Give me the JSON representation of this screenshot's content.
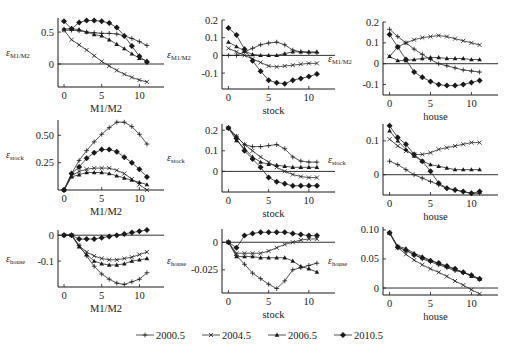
{
  "chart_data": {
    "type": "line",
    "layout": "3x3 grid of small-multiple line charts",
    "legend": {
      "placement": "bottom-center",
      "entries": [
        {
          "name": "2000.5",
          "marker": "plus"
        },
        {
          "name": "2004.5",
          "marker": "cross"
        },
        {
          "name": "2006.5",
          "marker": "triangle"
        },
        {
          "name": "2010.5",
          "marker": "diamond"
        }
      ]
    },
    "x": [
      0,
      1,
      2,
      3,
      4,
      5,
      6,
      7,
      8,
      9,
      10,
      11
    ],
    "panels": [
      {
        "id": "m1m2-response-to-m1m2",
        "ylabel_main": "ε",
        "ylabel_sub": "M1/M2",
        "xlabel": "M1/M2",
        "xticks": [
          0,
          5,
          10
        ],
        "xlim": [
          -0.8,
          13
        ],
        "yticks": [
          0,
          0.5
        ],
        "ytick_labels": [
          "0",
          "0.5"
        ],
        "ylim": [
          -0.36,
          0.72
        ],
        "series": [
          {
            "name": "2000.5",
            "values": [
              0.53,
              0.53,
              0.52,
              0.5,
              0.49,
              0.48,
              0.48,
              0.47,
              0.44,
              0.4,
              0.35,
              0.29
            ]
          },
          {
            "name": "2004.5",
            "values": [
              0.53,
              0.38,
              0.3,
              0.22,
              0.13,
              0.04,
              -0.03,
              -0.1,
              -0.16,
              -0.21,
              -0.25,
              -0.28
            ]
          },
          {
            "name": "2006.5",
            "values": [
              0.55,
              0.55,
              0.54,
              0.5,
              0.46,
              0.44,
              0.38,
              0.31,
              0.24,
              0.16,
              0.09,
              0.05
            ]
          },
          {
            "name": "2010.5",
            "values": [
              0.67,
              0.55,
              0.65,
              0.68,
              0.68,
              0.67,
              0.64,
              0.57,
              0.44,
              0.28,
              0.12,
              0.03
            ]
          }
        ]
      },
      {
        "id": "m1m2-response-to-stock",
        "ylabel_main": "ε",
        "ylabel_sub": "M1/M2",
        "xlabel": "stock",
        "xticks": [
          0,
          5,
          10
        ],
        "xlim": [
          -0.8,
          13
        ],
        "yticks": [
          -0.1,
          0,
          0.1,
          0.2
        ],
        "ytick_labels": [
          "-0.1",
          "0",
          "0.1",
          "0.2"
        ],
        "ylim": [
          -0.19,
          0.2
        ],
        "series": [
          {
            "name": "2000.5",
            "values": [
              0.0,
              0.0,
              0.02,
              0.04,
              0.06,
              0.07,
              0.075,
              0.06,
              0.03,
              0.02,
              0.015,
              0.015
            ]
          },
          {
            "name": "2004.5",
            "values": [
              0.04,
              0.02,
              0.0,
              -0.02,
              -0.04,
              -0.06,
              -0.065,
              -0.06,
              -0.055,
              -0.05,
              -0.045,
              -0.045
            ]
          },
          {
            "name": "2006.5",
            "values": [
              0.075,
              0.05,
              0.025,
              0.005,
              0.0,
              0.0,
              0.0,
              0.01,
              0.02,
              0.02,
              0.02,
              0.02
            ]
          },
          {
            "name": "2010.5",
            "values": [
              0.155,
              0.115,
              0.035,
              -0.03,
              -0.09,
              -0.14,
              -0.155,
              -0.16,
              -0.14,
              -0.13,
              -0.12,
              -0.105
            ]
          }
        ]
      },
      {
        "id": "m1m2-response-to-house",
        "ylabel_main": "ε",
        "ylabel_sub": "M1/M2",
        "xlabel": "house",
        "xticks": [
          0,
          5,
          10
        ],
        "xlim": [
          -0.8,
          13
        ],
        "yticks": [
          -0.1,
          0,
          0.1,
          0.2
        ],
        "ytick_labels": [
          "-0.1",
          "0",
          "0.1",
          "0.2"
        ],
        "ylim": [
          -0.15,
          0.2
        ],
        "series": [
          {
            "name": "2000.5",
            "values": [
              0.165,
              0.13,
              0.1,
              0.07,
              0.045,
              0.02,
              0.0,
              -0.01,
              -0.02,
              -0.03,
              -0.035,
              -0.04
            ]
          },
          {
            "name": "2004.5",
            "values": [
              0.035,
              0.08,
              0.1,
              0.115,
              0.125,
              0.13,
              0.135,
              0.13,
              0.12,
              0.11,
              0.1,
              0.09
            ]
          },
          {
            "name": "2006.5",
            "values": [
              0.035,
              0.015,
              0.015,
              0.02,
              0.025,
              0.03,
              0.03,
              0.025,
              0.025,
              0.025,
              0.02,
              0.02
            ]
          },
          {
            "name": "2010.5",
            "values": [
              0.14,
              0.08,
              0.02,
              -0.04,
              -0.065,
              -0.085,
              -0.1,
              -0.105,
              -0.105,
              -0.1,
              -0.09,
              -0.08
            ]
          }
        ]
      },
      {
        "id": "stock-response-to-m1m2",
        "ylabel_main": "ε",
        "ylabel_sub": "stock",
        "xlabel": "M1/M2",
        "xticks": [
          0,
          5,
          10
        ],
        "xlim": [
          -0.8,
          13
        ],
        "yticks": [
          0.25,
          0.5
        ],
        "ytick_labels": [
          "0.25",
          "0.50"
        ],
        "ylim": [
          0,
          0.64
        ],
        "series": [
          {
            "name": "2000.5",
            "values": [
              0.0,
              0.15,
              0.27,
              0.36,
              0.44,
              0.51,
              0.57,
              0.62,
              0.62,
              0.58,
              0.51,
              0.42
            ]
          },
          {
            "name": "2004.5",
            "values": [
              0.0,
              0.13,
              0.17,
              0.19,
              0.2,
              0.2,
              0.2,
              0.18,
              0.15,
              0.1,
              0.05,
              0.0
            ]
          },
          {
            "name": "2006.5",
            "values": [
              0.0,
              0.12,
              0.14,
              0.16,
              0.16,
              0.16,
              0.15,
              0.13,
              0.11,
              0.09,
              0.07,
              0.05
            ]
          },
          {
            "name": "2010.5",
            "values": [
              0.0,
              0.15,
              0.21,
              0.29,
              0.34,
              0.37,
              0.37,
              0.35,
              0.3,
              0.25,
              0.19,
              0.12
            ]
          }
        ]
      },
      {
        "id": "stock-response-to-stock",
        "ylabel_main": "ε",
        "ylabel_sub": "stock",
        "xlabel": "stock",
        "xticks": [
          0,
          5,
          10
        ],
        "xlim": [
          -0.8,
          13
        ],
        "yticks": [
          0,
          0.1,
          0.2
        ],
        "ytick_labels": [
          "0",
          "0.1",
          "0.2"
        ],
        "ylim": [
          -0.1,
          0.23
        ],
        "series": [
          {
            "name": "2000.5",
            "values": [
              0.21,
              0.17,
              0.13,
              0.12,
              0.12,
              0.125,
              0.13,
              0.11,
              0.07,
              0.05,
              0.045,
              0.045
            ]
          },
          {
            "name": "2004.5",
            "values": [
              0.21,
              0.17,
              0.13,
              0.1,
              0.07,
              0.045,
              0.02,
              0.0,
              -0.015,
              -0.025,
              -0.03,
              -0.03
            ]
          },
          {
            "name": "2006.5",
            "values": [
              0.21,
              0.15,
              0.11,
              0.07,
              0.045,
              0.035,
              0.03,
              0.025,
              0.02,
              0.02,
              0.02,
              0.02
            ]
          },
          {
            "name": "2010.5",
            "values": [
              0.21,
              0.16,
              0.1,
              0.06,
              0.02,
              -0.03,
              -0.05,
              -0.06,
              -0.07,
              -0.07,
              -0.07,
              -0.07
            ]
          }
        ]
      },
      {
        "id": "stock-response-to-house",
        "ylabel_main": "ε",
        "ylabel_sub": "stock",
        "xlabel": "house",
        "xticks": [
          0,
          5,
          10
        ],
        "xlim": [
          -0.8,
          13
        ],
        "yticks": [
          0,
          0.1
        ],
        "ytick_labels": [
          "0",
          "0.1"
        ],
        "ylim": [
          -0.06,
          0.15
        ],
        "series": [
          {
            "name": "2000.5",
            "values": [
              0.04,
              0.03,
              0.015,
              0.0,
              -0.01,
              -0.02,
              -0.03,
              -0.04,
              -0.045,
              -0.05,
              -0.055,
              -0.055
            ]
          },
          {
            "name": "2004.5",
            "values": [
              0.105,
              0.085,
              0.07,
              0.06,
              0.06,
              0.065,
              0.075,
              0.08,
              0.085,
              0.09,
              0.095,
              0.095
            ]
          },
          {
            "name": "2006.5",
            "values": [
              0.13,
              0.1,
              0.075,
              0.055,
              0.04,
              0.03,
              0.025,
              0.02,
              0.015,
              0.015,
              0.015,
              0.015
            ]
          },
          {
            "name": "2010.5",
            "values": [
              0.145,
              0.11,
              0.09,
              0.06,
              0.04,
              0.01,
              -0.025,
              -0.04,
              -0.045,
              -0.05,
              -0.055,
              -0.05
            ]
          }
        ]
      },
      {
        "id": "house-response-to-m1m2",
        "ylabel_main": "ε",
        "ylabel_sub": "house",
        "xlabel": "M1/M2",
        "xticks": [
          0,
          5,
          10
        ],
        "xlim": [
          -0.8,
          13
        ],
        "yticks": [
          -0.1,
          0
        ],
        "ytick_labels": [
          "-0.1",
          "0"
        ],
        "ylim": [
          -0.2,
          0.02
        ],
        "series": [
          {
            "name": "2000.5",
            "values": [
              0.0,
              0.0,
              -0.04,
              -0.08,
              -0.12,
              -0.15,
              -0.17,
              -0.185,
              -0.19,
              -0.18,
              -0.17,
              -0.145
            ]
          },
          {
            "name": "2004.5",
            "values": [
              0.0,
              0.0,
              -0.04,
              -0.065,
              -0.08,
              -0.09,
              -0.095,
              -0.095,
              -0.09,
              -0.085,
              -0.075,
              -0.065
            ]
          },
          {
            "name": "2006.5",
            "values": [
              0.0,
              0.0,
              -0.045,
              -0.075,
              -0.1,
              -0.11,
              -0.115,
              -0.115,
              -0.11,
              -0.1,
              -0.095,
              -0.09
            ]
          },
          {
            "name": "2010.5",
            "values": [
              0.0,
              0.0,
              -0.015,
              -0.015,
              -0.015,
              -0.01,
              -0.005,
              0.0,
              0.005,
              0.01,
              0.015,
              0.02
            ]
          }
        ]
      },
      {
        "id": "house-response-to-stock",
        "ylabel_main": "ε",
        "ylabel_sub": "house",
        "xlabel": "stock",
        "xticks": [
          0,
          5,
          10
        ],
        "xlim": [
          -0.8,
          13
        ],
        "yticks": [
          -0.025,
          0
        ],
        "ytick_labels": [
          "-0.025",
          "0"
        ],
        "ylim": [
          -0.046,
          0.012
        ],
        "series": [
          {
            "name": "2000.5",
            "values": [
              0.0,
              -0.012,
              -0.02,
              -0.028,
              -0.033,
              -0.038,
              -0.042,
              -0.035,
              -0.025,
              -0.023,
              -0.021,
              -0.019
            ]
          },
          {
            "name": "2004.5",
            "values": [
              0.0,
              -0.01,
              -0.01,
              -0.01,
              -0.01,
              -0.008,
              -0.005,
              -0.002,
              0.0,
              0.002,
              0.003,
              0.003
            ]
          },
          {
            "name": "2006.5",
            "values": [
              0.0,
              -0.013,
              -0.013,
              -0.013,
              -0.014,
              -0.014,
              -0.014,
              -0.014,
              -0.017,
              -0.022,
              -0.024,
              -0.027
            ]
          },
          {
            "name": "2010.5",
            "values": [
              0.0,
              -0.005,
              0.006,
              0.008,
              0.009,
              0.009,
              0.009,
              0.009,
              0.008,
              0.007,
              0.006,
              0.006
            ]
          }
        ]
      },
      {
        "id": "house-response-to-house",
        "ylabel_main": "ε",
        "ylabel_sub": "house",
        "xlabel": "house",
        "xticks": [
          0,
          5,
          10
        ],
        "xlim": [
          -0.8,
          13
        ],
        "yticks": [
          0,
          0.05,
          0.1
        ],
        "ytick_labels": [
          "0",
          "0.05",
          "0.10"
        ],
        "ylim": [
          -0.012,
          0.105
        ],
        "series": [
          {
            "name": "2000.5",
            "values": [
              0.095,
              0.07,
              0.065,
              0.058,
              0.05,
              0.045,
              0.04,
              0.035,
              0.03,
              0.027,
              0.022,
              0.015
            ]
          },
          {
            "name": "2004.5",
            "values": [
              0.095,
              0.07,
              0.058,
              0.048,
              0.04,
              0.033,
              0.027,
              0.02,
              0.012,
              0.005,
              -0.003,
              -0.01
            ]
          },
          {
            "name": "2006.5",
            "values": [
              0.095,
              0.072,
              0.068,
              0.06,
              0.054,
              0.048,
              0.042,
              0.037,
              0.032,
              0.027,
              0.02,
              0.015
            ]
          },
          {
            "name": "2010.5",
            "values": [
              0.095,
              0.07,
              0.065,
              0.057,
              0.052,
              0.047,
              0.043,
              0.038,
              0.033,
              0.027,
              0.022,
              0.016
            ]
          }
        ]
      }
    ]
  }
}
